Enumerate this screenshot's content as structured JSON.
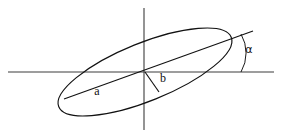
{
  "figure": {
    "background_color": "#ffffff",
    "stroke_color": "#111111",
    "axis_color": "#3c3c3c",
    "width": 289,
    "height": 137
  },
  "labels": {
    "semi_major": "a",
    "semi_minor": "b",
    "angle": "α"
  },
  "geometry": {
    "center": {
      "x": 145,
      "y": 72
    },
    "semi_major_axis": 93,
    "semi_minor_axis": 29,
    "rotation_degrees": -22,
    "x_axis": {
      "x1": 8,
      "y1": 72,
      "x2": 274,
      "y2": 72
    },
    "y_axis": {
      "x1": 144,
      "y1": 8,
      "x2": 144,
      "y2": 130
    },
    "major_axis_segment": {
      "x1": 64,
      "y1": 99,
      "x2": 253,
      "y2": 31
    },
    "minor_axis_segment": {
      "x1": 145,
      "y1": 72,
      "x2": 159,
      "y2": 92
    },
    "angle_vertex": {
      "x": 241,
      "y": 72
    },
    "angle_arc_radius": 38,
    "label_positions": {
      "a": {
        "x": 97,
        "y": 92
      },
      "b": {
        "x": 163,
        "y": 79
      },
      "alpha": {
        "x": 249,
        "y": 50
      }
    }
  }
}
